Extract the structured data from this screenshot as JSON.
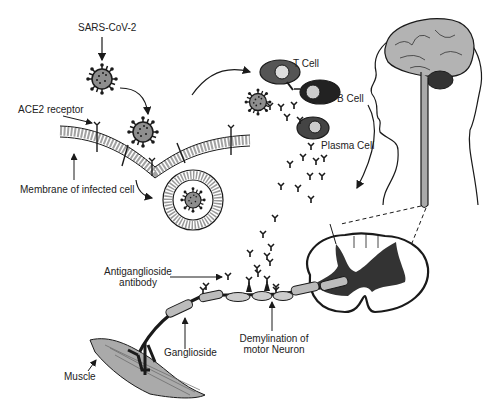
{
  "labels": {
    "virus": "SARS-CoV-2",
    "ace2": "ACE2 receptor",
    "membrane": "Membrane of infected cell",
    "t_cell": "T Cell",
    "b_cell": "B Cell",
    "plasma_cell": "Plasma Cell",
    "antibody_line1": "Antiganglioside",
    "antibody_line2": "antibody",
    "demyelination_line1": "Demylination of",
    "demyelination_line2": "motor Neuron",
    "ganglioside": "Ganglioside",
    "muscle": "Muscle"
  },
  "colors": {
    "ink": "#1a1a1a",
    "gray_fill": "#9a9a9a",
    "light_gray": "#bdbdbd",
    "dark_fill": "#2b2b2b",
    "background": "#ffffff"
  }
}
